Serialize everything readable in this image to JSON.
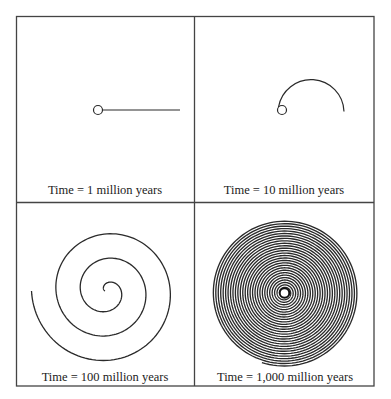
{
  "panels": [
    {
      "id": "p1",
      "label": "Time = 1 million years"
    },
    {
      "id": "p2",
      "label": "Time = 10 million years"
    },
    {
      "id": "p3",
      "label": "Time = 100 million years"
    },
    {
      "id": "p4",
      "label": "Time = 1,000 million years"
    }
  ],
  "colors": {
    "line": "#2a2a2a",
    "border": "#444444",
    "background": "#ffffff"
  }
}
